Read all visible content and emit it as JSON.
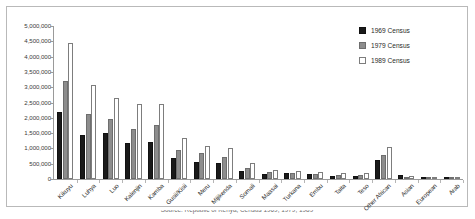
{
  "chart_data": {
    "type": "bar",
    "title": "",
    "xlabel": "",
    "ylabel": "",
    "ylim": [
      0,
      5000000
    ],
    "ytick_step": 500000,
    "grid": false,
    "legend_position": "top-right",
    "yticks": [
      "5,000,000",
      "4,500,000",
      "4,000,000",
      "3,500,000",
      "3,000,000",
      "2,500,000",
      "2,000,000",
      "1,500,000",
      "1,000,000",
      "500,000",
      "0"
    ],
    "categories": [
      "Kikuyu",
      "Luhya",
      "Luo",
      "Kalenjin",
      "Kamba",
      "Gusii/Kisii",
      "Meru",
      "Mijikenda",
      "Somali",
      "Maasai",
      "Turkana",
      "Embu",
      "Taita",
      "Teso",
      "Other African",
      "Asian",
      "European",
      "Arab"
    ],
    "series": [
      {
        "name": "1969 Census",
        "color": "#1a1a1a",
        "values": [
          2200000,
          1450000,
          1520000,
          1190000,
          1200000,
          700000,
          560000,
          520000,
          250000,
          155000,
          200000,
          180000,
          110000,
          90000,
          610000,
          140000,
          40000,
          28000
        ]
      },
      {
        "name": "1979 Census",
        "color": "#8d8d8d",
        "values": [
          3200000,
          2130000,
          1960000,
          1650000,
          1750000,
          950000,
          860000,
          730000,
          370000,
          240000,
          200000,
          160000,
          130000,
          130000,
          800000,
          80000,
          40000,
          32000
        ]
      },
      {
        "name": "1989 Census",
        "color": "#ffffff",
        "values": [
          4450000,
          3080000,
          2650000,
          2450000,
          2450000,
          1330000,
          1090000,
          1020000,
          520000,
          290000,
          260000,
          240000,
          200000,
          200000,
          1060000,
          90000,
          40000,
          38000
        ]
      }
    ]
  },
  "legend": {
    "items": [
      {
        "label": "1969 Census",
        "swatch": "black-filled-square"
      },
      {
        "label": "1979 Census",
        "swatch": "gray-filled-square"
      },
      {
        "label": "1989 Census",
        "swatch": "white-outlined-square"
      }
    ]
  },
  "caption": {
    "text": "Source: Republic of Kenya, Census 1969, 1979, 1989"
  }
}
